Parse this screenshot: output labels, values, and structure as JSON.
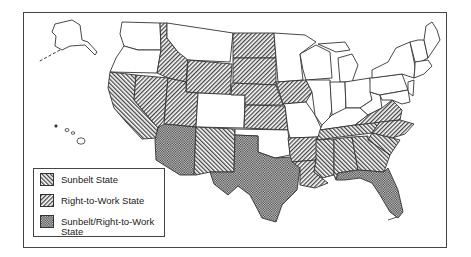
{
  "figure": {
    "type": "choropleth-map",
    "region": "United States",
    "colors": {
      "stroke": "#333333",
      "background": "#ffffff",
      "hatch": "#444444"
    }
  },
  "legend": {
    "items": [
      {
        "label": "Sunbelt State",
        "pattern": "hatch-back-diagonal"
      },
      {
        "label": "Right-to-Work State",
        "pattern": "hatch-forward-diagonal"
      },
      {
        "label": "Sunbelt/Right-to-Work State",
        "pattern": "crosshatch-dense"
      }
    ]
  },
  "categories": {
    "sunbelt": [
      "California",
      "New Mexico",
      "Mississippi",
      "Alabama",
      "Georgia",
      "South Carolina",
      "Tennessee"
    ],
    "right_to_work": [
      "Nevada",
      "Utah",
      "Idaho",
      "Wyoming",
      "North Dakota",
      "South Dakota",
      "Nebraska",
      "Iowa",
      "Kansas",
      "Arkansas",
      "Virginia",
      "North Carolina",
      "Louisiana"
    ],
    "sunbelt_and_right_to_work": [
      "Arizona",
      "Texas",
      "Florida"
    ]
  }
}
